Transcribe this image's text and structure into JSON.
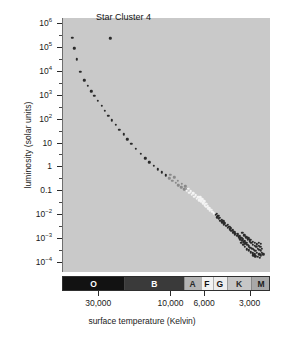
{
  "chart_data": {
    "type": "scatter",
    "title": "Star Cluster 4",
    "xlabel": "surface temperature (Kelvin)",
    "ylabel": "luminosity (solar units)",
    "grid": false,
    "legend": "none",
    "x_axis": {
      "scale": "log-reversed",
      "unit": "Kelvin",
      "min": 2200,
      "max": 52000,
      "tick_values": [
        30000,
        10000,
        6000,
        3000
      ],
      "tick_labels": [
        "30,000",
        "10,000",
        "6,000",
        "3,000"
      ]
    },
    "y_axis": {
      "scale": "log",
      "unit": "solar units",
      "min": 0.0001,
      "max": 1000000,
      "tick_values": [
        1000000,
        100000,
        10000,
        1000,
        100,
        10,
        1,
        0.1,
        0.01,
        0.001,
        0.0001
      ],
      "tick_labels": [
        "10⁶",
        "10⁵",
        "10⁴",
        "10³",
        "10²",
        "10",
        "1",
        "0.1",
        "10⁻²",
        "10⁻³",
        "10⁻⁴"
      ],
      "tick_mantissas": [
        "10",
        "10",
        "10",
        "10",
        "10",
        "10",
        "1",
        "0.1",
        "10",
        "10",
        "10"
      ],
      "tick_exponents": [
        "6",
        "5",
        "4",
        "3",
        "2",
        "",
        "",
        "",
        "-2",
        "-3",
        "-4"
      ]
    },
    "spectral_classes": [
      {
        "label": "O",
        "x_start": 0.0,
        "x_end": 0.295,
        "color": "#121212",
        "text_color": "#ffffff"
      },
      {
        "label": "B",
        "x_start": 0.295,
        "x_end": 0.582,
        "color": "#3a3a3a",
        "text_color": "#ffffff"
      },
      {
        "label": "A",
        "x_start": 0.582,
        "x_end": 0.663,
        "color": "#b4b4b4",
        "text_color": "#2a2a2a"
      },
      {
        "label": "F",
        "x_start": 0.663,
        "x_end": 0.721,
        "color": "#f2f2f2",
        "text_color": "#111111"
      },
      {
        "label": "G",
        "x_start": 0.721,
        "x_end": 0.788,
        "color": "#ededed",
        "text_color": "#111111"
      },
      {
        "label": "K",
        "x_start": 0.788,
        "x_end": 0.904,
        "color": "#c6c6c6",
        "text_color": "#2a2a2a"
      },
      {
        "label": "M",
        "x_start": 0.904,
        "x_end": 1.0,
        "color": "#a8a8a8",
        "text_color": "#1c1c1c"
      }
    ],
    "colors": {
      "plot_background": "#c9c9c9",
      "page_background": "#ffffff",
      "axis": "#2b2b2b",
      "text": "#1a1a1a",
      "star_dark": "#2a2a2a",
      "star_light": "#f4f4f4"
    },
    "series": [
      {
        "name": "main sequence (hot, luminous)",
        "shade": "dark",
        "points": [
          [
            0.05,
            0.078
          ],
          [
            0.06,
            0.12
          ],
          [
            0.07,
            0.163
          ],
          [
            0.088,
            0.213
          ],
          [
            0.107,
            0.246
          ],
          [
            0.124,
            0.268
          ],
          [
            0.14,
            0.288
          ],
          [
            0.156,
            0.307
          ],
          [
            0.172,
            0.325
          ],
          [
            0.19,
            0.345
          ],
          [
            0.206,
            0.366
          ],
          [
            0.222,
            0.385
          ],
          [
            0.24,
            0.403
          ],
          [
            0.258,
            0.421
          ],
          [
            0.276,
            0.44
          ],
          [
            0.296,
            0.458
          ],
          [
            0.314,
            0.477
          ],
          [
            0.334,
            0.496
          ],
          [
            0.355,
            0.515
          ],
          [
            0.378,
            0.535
          ],
          [
            0.4,
            0.553
          ],
          [
            0.42,
            0.568
          ],
          [
            0.442,
            0.582
          ],
          [
            0.462,
            0.596
          ],
          [
            0.481,
            0.608
          ],
          [
            0.499,
            0.62
          ]
        ]
      },
      {
        "name": "main sequence (intermediate, A-F)",
        "shade": "mid",
        "points": [
          [
            0.516,
            0.631
          ],
          [
            0.531,
            0.641
          ],
          [
            0.546,
            0.65
          ],
          [
            0.56,
            0.658
          ],
          [
            0.574,
            0.666
          ],
          [
            0.588,
            0.674
          ],
          [
            0.52,
            0.617
          ],
          [
            0.54,
            0.627
          ],
          [
            0.558,
            0.64
          ],
          [
            0.575,
            0.652
          ],
          [
            0.592,
            0.662
          ],
          [
            0.602,
            0.672
          ]
        ]
      },
      {
        "name": "main sequence (solar type, F-G)",
        "shade": "light",
        "points": [
          [
            0.6,
            0.68
          ],
          [
            0.612,
            0.688
          ],
          [
            0.624,
            0.696
          ],
          [
            0.636,
            0.703
          ],
          [
            0.648,
            0.711
          ],
          [
            0.659,
            0.718
          ],
          [
            0.606,
            0.672
          ],
          [
            0.618,
            0.681
          ],
          [
            0.63,
            0.689
          ],
          [
            0.642,
            0.697
          ],
          [
            0.654,
            0.705
          ],
          [
            0.666,
            0.713
          ],
          [
            0.67,
            0.722
          ],
          [
            0.678,
            0.729
          ],
          [
            0.686,
            0.736
          ],
          [
            0.694,
            0.743
          ],
          [
            0.702,
            0.75
          ],
          [
            0.71,
            0.757
          ],
          [
            0.664,
            0.706
          ],
          [
            0.674,
            0.714
          ],
          [
            0.684,
            0.722
          ],
          [
            0.692,
            0.731
          ],
          [
            0.7,
            0.74
          ],
          [
            0.708,
            0.748
          ],
          [
            0.716,
            0.755
          ],
          [
            0.722,
            0.762
          ],
          [
            0.73,
            0.768
          ]
        ]
      },
      {
        "name": "main sequence (cool, K-M dwarfs)",
        "shade": "dark",
        "points": [
          [
            0.738,
            0.776
          ],
          [
            0.746,
            0.784
          ],
          [
            0.754,
            0.791
          ],
          [
            0.762,
            0.798
          ],
          [
            0.77,
            0.805
          ],
          [
            0.778,
            0.812
          ],
          [
            0.744,
            0.77
          ],
          [
            0.752,
            0.778
          ],
          [
            0.76,
            0.786
          ],
          [
            0.768,
            0.794
          ],
          [
            0.776,
            0.801
          ],
          [
            0.784,
            0.808
          ],
          [
            0.79,
            0.818
          ],
          [
            0.798,
            0.825
          ],
          [
            0.806,
            0.832
          ],
          [
            0.814,
            0.839
          ],
          [
            0.822,
            0.846
          ],
          [
            0.83,
            0.852
          ],
          [
            0.796,
            0.814
          ],
          [
            0.804,
            0.821
          ],
          [
            0.812,
            0.828
          ],
          [
            0.82,
            0.836
          ],
          [
            0.828,
            0.843
          ],
          [
            0.836,
            0.85
          ],
          [
            0.842,
            0.858
          ],
          [
            0.85,
            0.864
          ],
          [
            0.858,
            0.871
          ],
          [
            0.866,
            0.877
          ],
          [
            0.874,
            0.883
          ],
          [
            0.882,
            0.889
          ],
          [
            0.846,
            0.852
          ],
          [
            0.854,
            0.859
          ],
          [
            0.862,
            0.866
          ],
          [
            0.87,
            0.872
          ],
          [
            0.878,
            0.879
          ],
          [
            0.886,
            0.885
          ],
          [
            0.89,
            0.894
          ],
          [
            0.898,
            0.899
          ],
          [
            0.906,
            0.904
          ],
          [
            0.914,
            0.909
          ],
          [
            0.922,
            0.913
          ],
          [
            0.93,
            0.917
          ],
          [
            0.894,
            0.872
          ],
          [
            0.902,
            0.879
          ],
          [
            0.91,
            0.886
          ],
          [
            0.918,
            0.892
          ],
          [
            0.926,
            0.897
          ],
          [
            0.934,
            0.902
          ],
          [
            0.866,
            0.846
          ],
          [
            0.876,
            0.855
          ],
          [
            0.886,
            0.863
          ],
          [
            0.896,
            0.868
          ],
          [
            0.906,
            0.874
          ],
          [
            0.916,
            0.88
          ],
          [
            0.926,
            0.886
          ],
          [
            0.936,
            0.891
          ],
          [
            0.946,
            0.896
          ],
          [
            0.94,
            0.908
          ],
          [
            0.948,
            0.912
          ],
          [
            0.956,
            0.917
          ],
          [
            0.908,
            0.922
          ],
          [
            0.918,
            0.926
          ],
          [
            0.928,
            0.93
          ],
          [
            0.938,
            0.925
          ],
          [
            0.948,
            0.93
          ],
          [
            0.956,
            0.935
          ],
          [
            0.888,
            0.91
          ],
          [
            0.898,
            0.915
          ],
          [
            0.88,
            0.901
          ],
          [
            0.872,
            0.892
          ],
          [
            0.862,
            0.884
          ],
          [
            0.94,
            0.94
          ],
          [
            0.95,
            0.944
          ],
          [
            0.93,
            0.938
          ],
          [
            0.92,
            0.934
          ],
          [
            0.96,
            0.925
          ],
          [
            0.968,
            0.93
          ],
          [
            0.962,
            0.908
          ],
          [
            0.954,
            0.901
          ],
          [
            0.946,
            0.884
          ],
          [
            0.956,
            0.889
          ]
        ]
      },
      {
        "name": "isolated giant",
        "shade": "dark",
        "points": [
          [
            0.232,
            0.08
          ]
        ]
      }
    ]
  }
}
